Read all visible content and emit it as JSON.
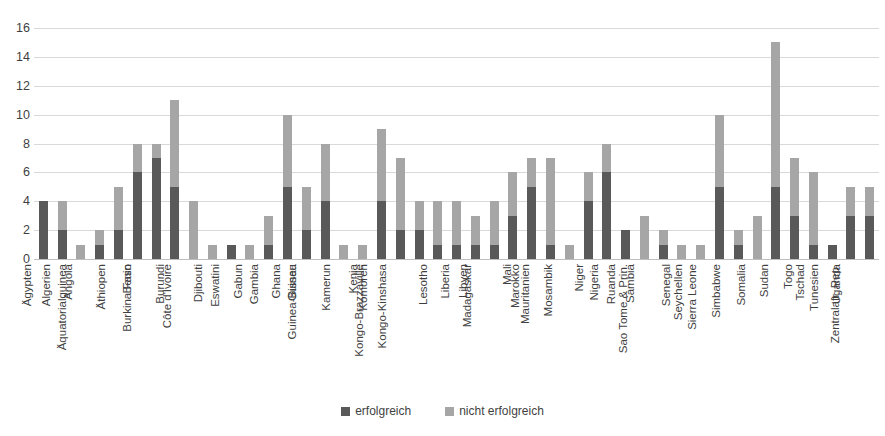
{
  "chart_data": {
    "type": "bar",
    "subtype": "stacked",
    "title": "",
    "xlabel": "",
    "ylabel": "",
    "ylim": [
      0,
      16
    ],
    "yticks": [
      0,
      2,
      4,
      6,
      8,
      10,
      12,
      14,
      16
    ],
    "grid": true,
    "legend_position": "bottom",
    "colors": {
      "erfolgreich": "#595959",
      "nicht erfolgreich": "#a6a6a6"
    },
    "categories": [
      "Ägypten",
      "Algerien",
      "Angola",
      "Äquatorialguinea",
      "Äthiopen",
      "Benin",
      "Burkina Faso",
      "Burundi",
      "Côte d'Ivoire",
      "Djibouti",
      "Eswatini",
      "Gabun",
      "Gambia",
      "Ghana",
      "Guinea",
      "Guinea-Bissau",
      "Kamerun",
      "Kenia",
      "Komoren",
      "Kongo-Brazzaville",
      "Kongo-Kinshasa",
      "Lesotho",
      "Liberia",
      "Libyen",
      "Madagaskar",
      "Mali",
      "Marokko",
      "Mauritanien",
      "Mosambik",
      "Niger",
      "Nigeria",
      "Ruanda",
      "Sambia",
      "Sao Tome & Prin.",
      "Senegal",
      "Seychellen",
      "Sierra Leone",
      "Simbabwe",
      "Somalia",
      "Sudan",
      "Togo",
      "Tschad",
      "Tunesien",
      "Uganda",
      "Zentralafr. Rep."
    ],
    "series": [
      {
        "name": "erfolgreich",
        "color": "#595959",
        "values": [
          4,
          2,
          0,
          1,
          2,
          6,
          7,
          5,
          0,
          0,
          1,
          0,
          1,
          5,
          2,
          4,
          0,
          0,
          4,
          2,
          2,
          1,
          1,
          1,
          1,
          3,
          5,
          1,
          0,
          4,
          6,
          2,
          0,
          1,
          0,
          0,
          5,
          1,
          0,
          5,
          3,
          1,
          1,
          3,
          3
        ]
      },
      {
        "name": "nicht erfolgreich",
        "color": "#a6a6a6",
        "values": [
          0,
          2,
          1,
          1,
          3,
          2,
          1,
          6,
          4,
          1,
          0,
          1,
          2,
          5,
          3,
          4,
          1,
          1,
          5,
          5,
          2,
          3,
          3,
          2,
          3,
          3,
          2,
          6,
          1,
          2,
          2,
          0,
          3,
          1,
          1,
          1,
          5,
          1,
          3,
          10,
          4,
          5,
          0,
          2,
          2
        ]
      }
    ],
    "totals": [
      4,
      4,
      1,
      2,
      5,
      8,
      8,
      11,
      4,
      1,
      1,
      1,
      3,
      10,
      5,
      8,
      1,
      1,
      9,
      7,
      4,
      4,
      4,
      3,
      4,
      6,
      7,
      7,
      1,
      6,
      8,
      2,
      3,
      2,
      1,
      1,
      10,
      2,
      3,
      15,
      7,
      6,
      1,
      5,
      5
    ]
  },
  "legend": {
    "items": [
      {
        "label": "erfolgreich",
        "color": "#595959"
      },
      {
        "label": "nicht erfolgreich",
        "color": "#a6a6a6"
      }
    ]
  }
}
